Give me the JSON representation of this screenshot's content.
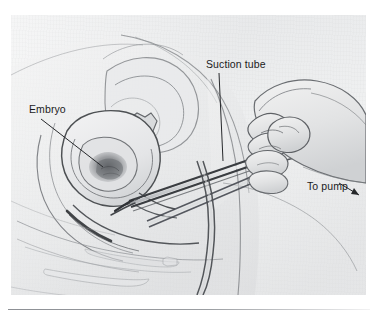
{
  "figure": {
    "kind": "medical-illustration",
    "panel": {
      "background_color": "#eeeff0",
      "x": 11,
      "y": 15,
      "width": 355,
      "height": 280
    },
    "line_color": "#3b3c3f",
    "text_color": "#1b1b1c",
    "labels": [
      {
        "id": "embryo",
        "text": "Embryo",
        "leader": "line",
        "points_to": "dark shaded embryonic mass inside the uterine cavity"
      },
      {
        "id": "suction-tube",
        "text": "Suction tube",
        "leader": "line",
        "points_to": "rigid cannula passing through the cervix"
      },
      {
        "id": "to-pump",
        "text": "To pump",
        "leader": "arrow",
        "points_to": "flexible tubing running off to the vacuum pump"
      }
    ],
    "depicted_structures": [
      "uterus",
      "embryo",
      "uterine cavity",
      "cervix",
      "vagina",
      "urinary bladder",
      "pubic bone",
      "rectum",
      "sacrum and coccyx",
      "abdominal wall",
      "suction cannula",
      "vacuum tubing",
      "clinician's gloved hand"
    ]
  },
  "bottom_rule": {
    "present": true,
    "color": "#8d9095"
  }
}
